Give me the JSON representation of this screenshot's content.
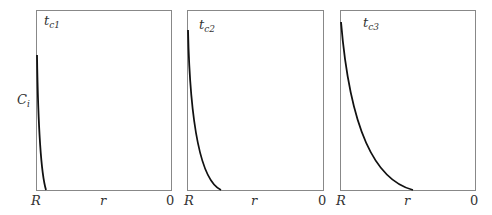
{
  "y_axis_label": {
    "main": "C",
    "sub": "i"
  },
  "panels": [
    {
      "title": {
        "main": "t",
        "sub": "c1"
      },
      "box": {
        "x0": 36,
        "y0": 10,
        "x1": 171,
        "y1": 190
      },
      "curve": "M37,55 C38,120 40,170 46,190",
      "x_labels": {
        "left": "R",
        "middle": "r",
        "right": "0"
      }
    },
    {
      "title": {
        "main": "t",
        "sub": "c2"
      },
      "box": {
        "x0": 187,
        "y0": 10,
        "x1": 323,
        "y1": 190
      },
      "curve": "M188,30 C190,120 200,180 221,190",
      "x_labels": {
        "left": "R",
        "middle": "r",
        "right": "0"
      }
    },
    {
      "title": {
        "main": "t",
        "sub": "c3"
      },
      "box": {
        "x0": 340,
        "y0": 10,
        "x1": 475,
        "y1": 190
      },
      "curve": "M341,22 C350,130 375,180 413,190",
      "x_labels": {
        "left": "R",
        "middle": "r",
        "right": "0"
      }
    }
  ],
  "colors": {
    "box": "#888888",
    "curve": "#111111",
    "text": "#333333"
  }
}
